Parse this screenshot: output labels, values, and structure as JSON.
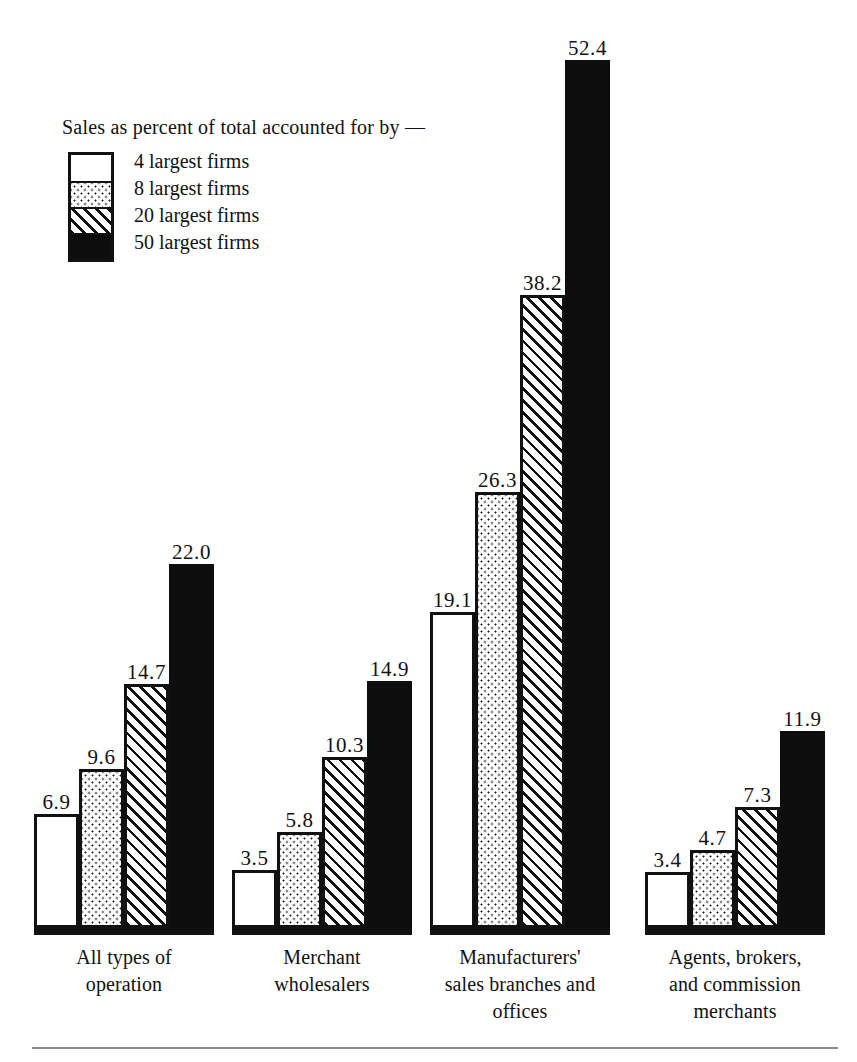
{
  "legend": {
    "title": "Sales as percent of total accounted for by —",
    "items": [
      {
        "label": "4 largest firms",
        "pattern": "plain"
      },
      {
        "label": "8 largest firms",
        "pattern": "dots"
      },
      {
        "label": "20 largest firms",
        "pattern": "hatch"
      },
      {
        "label": "50 largest firms",
        "pattern": "black"
      }
    ]
  },
  "chart_data": {
    "type": "bar",
    "title": "Sales as percent of total accounted for by —",
    "xlabel": "",
    "ylabel": "",
    "ylim": [
      0,
      52.4
    ],
    "grid": false,
    "legend_position": "top-left",
    "categories": [
      "All types of\noperation",
      "Merchant\nwholesalers",
      "Manufacturers'\nsales branches and\noffices",
      "Agents, brokers,\nand commission\nmerchants"
    ],
    "category_lines": [
      [
        "All types of",
        "operation"
      ],
      [
        "Merchant",
        "wholesalers"
      ],
      [
        "Manufacturers'",
        "sales branches and",
        "offices"
      ],
      [
        "Agents, brokers,",
        "and commission",
        "merchants"
      ]
    ],
    "series": [
      {
        "name": "4 largest firms",
        "values": [
          6.9,
          3.5,
          19.1,
          3.4
        ]
      },
      {
        "name": "8 largest firms",
        "values": [
          9.6,
          5.8,
          26.3,
          4.7
        ]
      },
      {
        "name": "20 largest firms",
        "values": [
          14.7,
          10.3,
          38.2,
          7.3
        ]
      },
      {
        "name": "50 largest firms",
        "values": [
          22.0,
          14.9,
          52.4,
          11.9
        ]
      }
    ],
    "data_labels": [
      [
        "6.9",
        "9.6",
        "14.7",
        "22.0"
      ],
      [
        "3.5",
        "5.8",
        "10.3",
        "14.9"
      ],
      [
        "19.1",
        "26.3",
        "38.2",
        "52.4"
      ],
      [
        "3.4",
        "4.7",
        "7.3",
        "11.9"
      ]
    ]
  },
  "colors": {
    "ink": "#111111",
    "paper": "#ffffff",
    "rule": "#8a8a8a"
  }
}
